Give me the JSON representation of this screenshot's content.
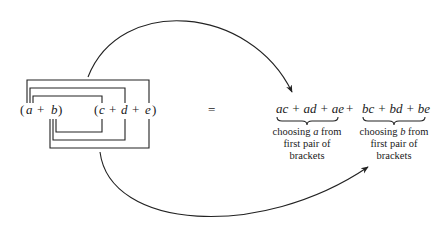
{
  "diagram": {
    "lhs": {
      "first_bracket": {
        "open": "(",
        "a": "a",
        "plus": "+",
        "b": "b",
        "close": ")"
      },
      "second_bracket": {
        "open": "(",
        "c": "c",
        "plus1": "+",
        "d": "d",
        "plus2": "+",
        "e": "e",
        "close": ")"
      }
    },
    "equals": "=",
    "rhs": {
      "group_a": {
        "expression": "ac + ad + ae",
        "caption_lines": [
          "choosing a from",
          "first pair of",
          "brackets"
        ],
        "caption_line1_pre": "choosing ",
        "caption_line1_var": "a",
        "caption_line1_post": " from"
      },
      "join_plus": "+",
      "group_b": {
        "expression": "bc + bd + be",
        "caption_lines": [
          "choosing b from",
          "first pair of",
          "brackets"
        ],
        "caption_line1_pre": "choosing ",
        "caption_line1_var": "b",
        "caption_line1_post": " from"
      }
    },
    "arrows": [
      {
        "from": "top connector (a-brackets)",
        "to": "ac + ad + ae"
      },
      {
        "from": "bottom connector (b-brackets)",
        "to": "bc + bd + be"
      }
    ],
    "connectors": {
      "top_from": "a",
      "top_to": [
        "c",
        "d",
        "e"
      ],
      "bottom_from": "b",
      "bottom_to": [
        "c",
        "d",
        "e"
      ]
    }
  }
}
